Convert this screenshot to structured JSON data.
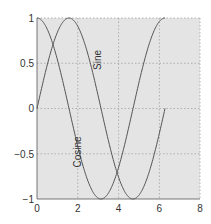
{
  "chart_data": {
    "type": "line",
    "title": "",
    "xlabel": "",
    "ylabel": "",
    "xlim": [
      0,
      8
    ],
    "ylim": [
      -1,
      1
    ],
    "grid": true,
    "xticks": [
      "0",
      "2",
      "4",
      "6",
      "8"
    ],
    "yticks": [
      "1",
      "0.5",
      "0",
      "-0.5",
      "-1"
    ],
    "series": [
      {
        "name": "Sine",
        "x": [
          0,
          0.5,
          1.0,
          1.5708,
          2.0,
          2.5,
          3.1416,
          3.5,
          4.0,
          4.7124,
          5.0,
          5.5,
          6.0,
          6.2832
        ],
        "values": [
          0,
          0.479,
          0.841,
          1.0,
          0.909,
          0.598,
          0.0,
          -0.351,
          -0.757,
          -1.0,
          -0.959,
          -0.706,
          -0.279,
          0.0
        ]
      },
      {
        "name": "Cosine",
        "x": [
          0,
          0.5,
          1.0,
          1.5708,
          2.0,
          2.5,
          3.1416,
          3.5,
          4.0,
          4.7124,
          5.0,
          5.5,
          6.0,
          6.2832
        ],
        "values": [
          1.0,
          0.878,
          0.54,
          0.0,
          -0.416,
          -0.801,
          -1.0,
          -0.936,
          -0.654,
          0.0,
          0.284,
          0.709,
          0.96,
          1.0
        ]
      }
    ],
    "annotations": [
      {
        "text": "Sine",
        "x": 2.95,
        "y": 0.54,
        "rotation": -90
      },
      {
        "text": "Cosine",
        "x": 2.0,
        "y": -0.48,
        "rotation": -90
      }
    ]
  },
  "labels": {
    "sine": "Sine",
    "cosine": "Cosine",
    "x0": "0",
    "x2": "2",
    "x4": "4",
    "x6": "6",
    "x8": "8",
    "y1": "1",
    "y05": "0.5",
    "y0": "0",
    "yn05": "−0.5",
    "yn1": "−1"
  }
}
